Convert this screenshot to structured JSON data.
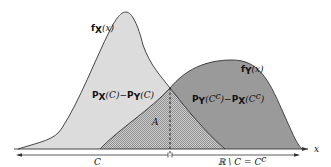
{
  "diagram": {
    "title": "",
    "labels": {
      "fx": "f",
      "fx_sub": "X",
      "fx_arg": "(x)",
      "fy": "f",
      "fy_sub": "Y",
      "fy_arg": "(x)",
      "px_minus_py_a": "P",
      "px_minus_py_a_sub": "X",
      "px_minus_py_a_arg": "(C)−",
      "px_minus_py_b": "P",
      "px_minus_py_b_sub": "Y",
      "px_minus_py_b_arg": "(C)",
      "py_minus_px_a": "P",
      "py_minus_px_a_sub": "Y",
      "py_minus_px_a_arg": "(C",
      "py_minus_px_a_sup": "c",
      "py_minus_px_a_close": ")−",
      "py_minus_px_b": "P",
      "py_minus_px_b_sub": "X",
      "py_minus_px_b_arg": "(C",
      "py_minus_px_b_sup": "c",
      "py_minus_px_b_close": ")",
      "overlap": "A",
      "axis": "x",
      "region_c": "C",
      "region_complement": "ℝ \\ C = C",
      "region_complement_sup": "c"
    },
    "colors": {
      "fx_fill": "#dcdcdc",
      "fy_fill": "#9a9a9a",
      "overlap_fill": "#bdbdbd",
      "stroke": "#333333"
    }
  }
}
